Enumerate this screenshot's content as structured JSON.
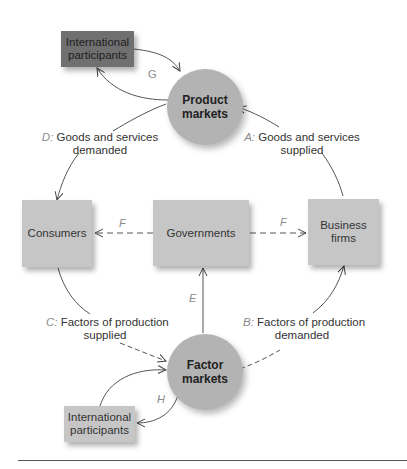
{
  "diagram": {
    "nodes": {
      "intl_top": {
        "label": "International participants",
        "line1": "International",
        "line2": "participants",
        "color": "#707070"
      },
      "product_markets": {
        "line1": "Product",
        "line2": "markets",
        "color": "#b3b3b3"
      },
      "consumers": {
        "label": "Consumers",
        "color": "#c6c6c6"
      },
      "governments": {
        "label": "Governments",
        "color": "#c6c6c6"
      },
      "business_firms": {
        "line1": "Business",
        "line2": "firms",
        "color": "#c6c6c6"
      },
      "factor_markets": {
        "line1": "Factor",
        "line2": "markets",
        "color": "#b3b3b3"
      },
      "intl_bottom": {
        "line1": "International",
        "line2": "participants",
        "color": "#c6c6c6"
      }
    },
    "flows": {
      "A": {
        "key": "A:",
        "line1": "Goods and services",
        "line2": "supplied"
      },
      "B": {
        "key": "B:",
        "line1": "Factors of production",
        "line2": "demanded"
      },
      "C": {
        "key": "C:",
        "line1": "Factors of production",
        "line2": "supplied"
      },
      "D": {
        "key": "D:",
        "line1": "Goods and services",
        "line2": "demanded"
      },
      "E": {
        "key": "E"
      },
      "F_left": {
        "key": "F"
      },
      "F_right": {
        "key": "F"
      },
      "G": {
        "key": "G"
      },
      "H": {
        "key": "H"
      }
    }
  }
}
